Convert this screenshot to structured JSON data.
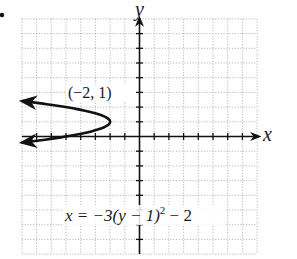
{
  "chart_data": {
    "type": "line",
    "title": "",
    "xlabel": "x",
    "ylabel": "y",
    "xlim": [
      -8,
      8
    ],
    "ylim": [
      -8,
      8
    ],
    "grid": true,
    "grid_step": 1,
    "equation": "x = −3(y − 1)^2 − 2",
    "equation_parts": {
      "main": "x = −3(y − 1)",
      "exponent": "2",
      "tail": " − 2"
    },
    "vertex": {
      "x": -2,
      "y": 1,
      "label": "(−2, 1)"
    },
    "series": [
      {
        "name": "x = -3(y - 1)^2 - 2",
        "orientation": "horizontal-parabola-opening-left",
        "points": [
          {
            "x": -8.0,
            "y": 2.41
          },
          {
            "x": -5.0,
            "y": 2.0
          },
          {
            "x": -2.75,
            "y": 1.5
          },
          {
            "x": -2.0,
            "y": 1.0
          },
          {
            "x": -2.75,
            "y": 0.5
          },
          {
            "x": -5.0,
            "y": 0.0
          },
          {
            "x": -8.0,
            "y": -0.41
          }
        ],
        "arrows_at_ends": true
      }
    ]
  },
  "labels": {
    "bullet": "•",
    "x_axis": "x",
    "y_axis": "y",
    "vertex": "(−2, 1)",
    "eq_main": "x = −3(y − 1)",
    "eq_exp": "2",
    "eq_tail": " − 2"
  }
}
